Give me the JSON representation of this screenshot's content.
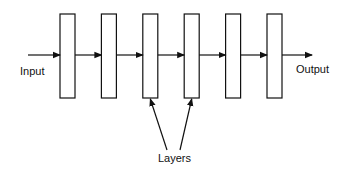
{
  "diagram": {
    "input_label": "Input",
    "output_label": "Output",
    "layers_label": "Layers",
    "layer_count": 6,
    "layers": [
      {
        "id": "layer-1"
      },
      {
        "id": "layer-2"
      },
      {
        "id": "layer-3"
      },
      {
        "id": "layer-4"
      },
      {
        "id": "layer-5"
      },
      {
        "id": "layer-6"
      }
    ],
    "edges": [
      {
        "from": "input",
        "to": "layer-1"
      },
      {
        "from": "layer-1",
        "to": "layer-2"
      },
      {
        "from": "layer-2",
        "to": "layer-3"
      },
      {
        "from": "layer-3",
        "to": "layer-4"
      },
      {
        "from": "layer-4",
        "to": "layer-5"
      },
      {
        "from": "layer-5",
        "to": "layer-6"
      },
      {
        "from": "layer-6",
        "to": "output"
      }
    ],
    "annotation_targets": [
      "layer-3",
      "layer-4"
    ],
    "colors": {
      "stroke": "#111111",
      "background": "#ffffff"
    }
  }
}
